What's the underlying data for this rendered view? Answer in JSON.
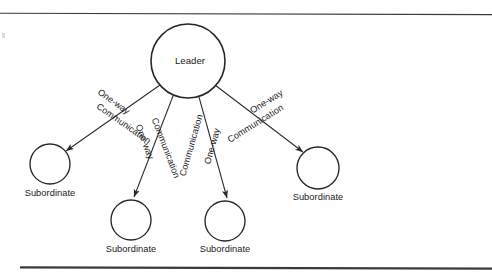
{
  "figure": {
    "background_color": "#ffffff",
    "stroke_color": "#262626",
    "text_color": "#1a1a1a"
  },
  "rules": {
    "top": {
      "name": "top-rule",
      "thickness": "1.1"
    },
    "bottom": {
      "name": "bottom-rule",
      "thickness": "2.1"
    }
  },
  "nodes": {
    "leader": {
      "label": "Leader",
      "cx": 188,
      "cy": 61,
      "r": 37
    },
    "subordinates": [
      {
        "label": "Subordinate",
        "cx": 50,
        "cy": 164,
        "r": 20,
        "label_x": 50,
        "label_y": 196
      },
      {
        "label": "Subordinate",
        "cx": 131,
        "cy": 220,
        "r": 20,
        "label_x": 131,
        "label_y": 252
      },
      {
        "label": "Subordinate",
        "cx": 225,
        "cy": 221,
        "r": 20,
        "label_x": 225,
        "label_y": 252
      },
      {
        "label": "Subordinate",
        "cx": 318,
        "cy": 168,
        "r": 21,
        "label_x": 318,
        "label_y": 200
      }
    ]
  },
  "edges": [
    {
      "name": "edge-leader-to-subordinate-1",
      "from": "leader",
      "to": "subordinate-1",
      "x1": 160,
      "y1": 85,
      "x2": 66,
      "y2": 151,
      "label_top": "One-way",
      "label_bottom": "Communication",
      "angle": 35,
      "top_x": 112,
      "top_y": 104,
      "bottom_x": 122,
      "bottom_y": 126
    },
    {
      "name": "edge-leader-to-subordinate-2",
      "from": "leader",
      "to": "subordinate-2",
      "x1": 173,
      "y1": 96,
      "x2": 134,
      "y2": 197,
      "label_top": "One-way",
      "label_bottom": "Communication",
      "angle": 69,
      "top_x": 142,
      "top_y": 143,
      "bottom_x": 163,
      "bottom_y": 149
    },
    {
      "name": "edge-leader-to-subordinate-3",
      "from": "leader",
      "to": "subordinate-3",
      "x1": 199,
      "y1": 97,
      "x2": 227,
      "y2": 198,
      "label_top": "One-way",
      "label_bottom": "Communication",
      "angle": -74,
      "top_x": 215,
      "top_y": 147,
      "bottom_x": 194,
      "bottom_y": 146
    },
    {
      "name": "edge-leader-to-subordinate-4",
      "from": "leader",
      "to": "subordinate-4",
      "x1": 215,
      "y1": 85,
      "x2": 303,
      "y2": 152,
      "label_top": "One-way",
      "label_bottom": "Communication",
      "angle": -32,
      "top_x": 268,
      "top_y": 104,
      "bottom_x": 257,
      "bottom_y": 126
    }
  ]
}
